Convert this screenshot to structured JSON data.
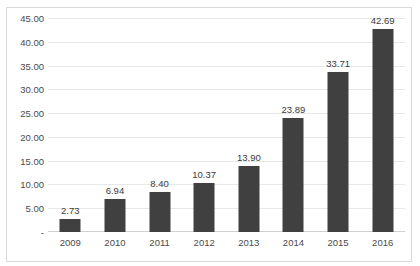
{
  "chart_data": {
    "type": "bar",
    "title": "",
    "xlabel": "",
    "ylabel": "",
    "categories": [
      "2009",
      "2010",
      "2011",
      "2012",
      "2013",
      "2014",
      "2015",
      "2016"
    ],
    "values": [
      2.73,
      6.94,
      8.4,
      10.37,
      13.9,
      23.89,
      33.71,
      42.69
    ],
    "data_labels": [
      "2.73",
      "6.94",
      "8.40",
      "10.37",
      "13.90",
      "23.89",
      "33.71",
      "42.69"
    ],
    "ylim": [
      0,
      45
    ],
    "y_ticks": [
      45,
      40,
      35,
      30,
      25,
      20,
      15,
      10,
      5,
      0
    ],
    "y_tick_labels": [
      "45.00",
      "40.00",
      "35.00",
      "30.00",
      "25.00",
      "20.00",
      "15.00",
      "10.00",
      "5.00",
      "-"
    ],
    "grid": true,
    "legend": false,
    "legend_position": "none",
    "series": [
      {
        "name": "",
        "color": "#404040",
        "values": [
          2.73,
          6.94,
          8.4,
          10.37,
          13.9,
          23.89,
          33.71,
          42.69
        ]
      }
    ]
  },
  "colors": {
    "bar": "#404040",
    "gridline": "#e8e8e8",
    "frame": "#d9d9d9",
    "text": "#4a4a4a",
    "background": "#ffffff"
  }
}
